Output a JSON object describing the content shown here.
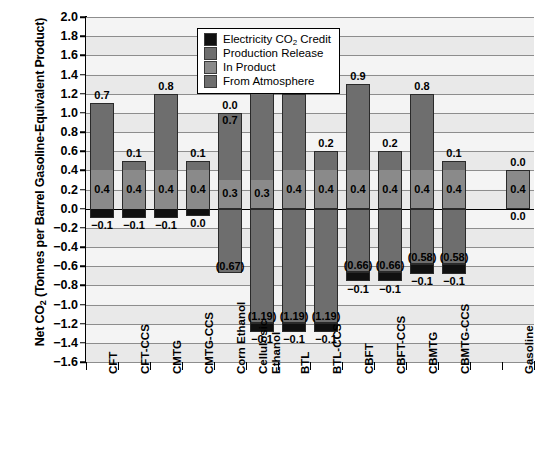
{
  "chart_data": {
    "type": "bar",
    "title": "",
    "xlabel": "",
    "ylabel": "Net CO2 (Tonnes per Barrel Gasoline-Equivalent Product)",
    "ylabel_prefix": "Net CO",
    "ylabel_sub": "2",
    "ylabel_suffix": " (Tonnes per Barrel Gasoline-Equivalent Product)",
    "ylim": [
      -1.6,
      2.0
    ],
    "ytick_step": 0.2,
    "ytick_labels": [
      "2.0",
      "1.8",
      "1.6",
      "1.4",
      "1.2",
      "1.0",
      "0.8",
      "0.6",
      "0.4",
      "0.2",
      "0.0",
      "−0.2",
      "−0.4",
      "−0.6",
      "−0.8",
      "−1.0",
      "−1.2",
      "−1.4",
      "−1.6"
    ],
    "grid": true,
    "legend_position": "top-center",
    "stacked": true,
    "categories": [
      "CFT",
      "CFT-CCS",
      "CMTG",
      "CMTG-CCS",
      "Corn Ethanol",
      "Cellulosic Ethanol",
      "BTL",
      "BTL-CCS",
      "CBFT",
      "CBFT-CCS",
      "CBMTG",
      "CBMTG-CCS",
      "",
      "Gasoline"
    ],
    "series": [
      {
        "name": "From Atmosphere",
        "color": "#6e6e6e",
        "values": [
          0,
          0,
          0,
          0,
          -0.67,
          -1.19,
          -1.19,
          -1.19,
          -0.66,
          -0.66,
          -0.58,
          -0.58,
          null,
          0
        ]
      },
      {
        "name": "In Product",
        "color": "#8a8a8a",
        "values": [
          0.4,
          0.4,
          0.4,
          0.4,
          0.3,
          0.3,
          0.4,
          0.4,
          0.4,
          0.4,
          0.4,
          0.4,
          null,
          0.4
        ]
      },
      {
        "name": "Production Release",
        "color": "#6e6e6e",
        "values": [
          0.7,
          0.1,
          0.8,
          0.1,
          0.0,
          1.0,
          0.8,
          0.2,
          0.9,
          0.2,
          0.8,
          0.1,
          null,
          0.0
        ]
      },
      {
        "name": "Electricity CO2 Credit",
        "color": "#101010",
        "values": [
          -0.1,
          -0.1,
          -0.1,
          0.0,
          0.0,
          -0.1,
          -0.1,
          -0.1,
          -0.1,
          -0.1,
          -0.1,
          -0.1,
          null,
          0.0
        ]
      }
    ],
    "bars": [
      {
        "category": "CFT",
        "top_label": "0.7",
        "mid_label": "0.4",
        "bottom_label": "−0.1",
        "atm_label": null,
        "top": 1.1,
        "pos_split": 0.4,
        "elec_bottom": -0.1
      },
      {
        "category": "CFT-CCS",
        "top_label": "0.1",
        "mid_label": "0.4",
        "bottom_label": "−0.1",
        "atm_label": null,
        "top": 0.5,
        "pos_split": 0.4,
        "elec_bottom": -0.1
      },
      {
        "category": "CMTG",
        "top_label": "0.8",
        "mid_label": "0.4",
        "bottom_label": "−0.1",
        "atm_label": null,
        "top": 1.2,
        "pos_split": 0.4,
        "elec_bottom": -0.1
      },
      {
        "category": "CMTG-CCS",
        "top_label": "0.1",
        "mid_label": "0.4",
        "bottom_label": "0.0",
        "atm_label": null,
        "top": 0.5,
        "pos_split": 0.4,
        "elec_bottom": -0.08
      },
      {
        "category": "Corn Ethanol",
        "top_label": "0.0",
        "mid_label": "0.3",
        "bottom_label": null,
        "atm_label": "(0.67)",
        "second_label": "0.7",
        "top": 1.0,
        "pos_split": 0.3,
        "elec_bottom": 0,
        "atm": -0.67
      },
      {
        "category": "Cellulosic Ethanol",
        "top_label": "1.0",
        "mid_label": "0.3",
        "bottom_label": "−0.1",
        "atm_label": "(1.19)",
        "top": 1.3,
        "pos_split": 0.3,
        "elec_bottom": -0.1,
        "atm": -1.19
      },
      {
        "category": "BTL",
        "top_label": "0.8",
        "mid_label": "0.4",
        "bottom_label": "−0.1",
        "atm_label": "(1.19)",
        "top": 1.2,
        "pos_split": 0.4,
        "elec_bottom": -0.1,
        "atm": -1.19
      },
      {
        "category": "BTL-CCS",
        "top_label": "0.2",
        "mid_label": "0.4",
        "bottom_label": "−0.1",
        "atm_label": "(1.19)",
        "top": 0.6,
        "pos_split": 0.4,
        "elec_bottom": -0.1,
        "atm": -1.19
      },
      {
        "category": "CBFT",
        "top_label": "0.9",
        "mid_label": "0.4",
        "bottom_label": "−0.1",
        "atm_label": "(0.66)",
        "top": 1.3,
        "pos_split": 0.4,
        "elec_bottom": -0.1,
        "atm": -0.66
      },
      {
        "category": "CBFT-CCS",
        "top_label": "0.2",
        "mid_label": "0.4",
        "bottom_label": "−0.1",
        "atm_label": "(0.66)",
        "top": 0.6,
        "pos_split": 0.4,
        "elec_bottom": -0.1,
        "atm": -0.66
      },
      {
        "category": "CBMTG",
        "top_label": "0.8",
        "mid_label": "0.4",
        "bottom_label": "−0.1",
        "atm_label": "(0.58)",
        "top": 1.2,
        "pos_split": 0.4,
        "elec_bottom": -0.1,
        "atm": -0.58
      },
      {
        "category": "CBMTG-CCS",
        "top_label": "0.1",
        "mid_label": "0.4",
        "bottom_label": "−0.1",
        "atm_label": "(0.58)",
        "top": 0.5,
        "pos_split": 0.4,
        "elec_bottom": -0.1,
        "atm": -0.58
      },
      {
        "category": "Gasoline",
        "top_label": "0.0",
        "mid_label": "0.4",
        "bottom_label": "0.0",
        "atm_label": null,
        "top": 0.4,
        "pos_split": 0.4,
        "elec_bottom": 0
      }
    ]
  },
  "legend": {
    "items": [
      {
        "label": "Electricity CO2 Credit",
        "label_prefix": "Electricity CO",
        "label_sub": "2",
        "label_suffix": " Credit",
        "color": "#101010"
      },
      {
        "label": "Production Release",
        "label_prefix": "Production Release",
        "label_sub": "",
        "label_suffix": "",
        "color": "#6e6e6e"
      },
      {
        "label": "In Product",
        "label_prefix": "In Product",
        "label_sub": "",
        "label_suffix": "",
        "color": "#8a8a8a"
      },
      {
        "label": "From Atmosphere",
        "label_prefix": "From Atmosphere",
        "label_sub": "",
        "label_suffix": "",
        "color": "#6e6e6e"
      }
    ]
  },
  "axis": {
    "y_tick_labels": [
      "2.0",
      "1.8",
      "1.6",
      "1.4",
      "1.2",
      "1.0",
      "0.8",
      "0.6",
      "0.4",
      "0.2",
      "0.0",
      "−0.2",
      "−0.4",
      "−0.6",
      "−0.8",
      "−1.0",
      "−1.2",
      "−1.4",
      "−1.6"
    ],
    "x_tick_labels": [
      "CFT",
      "CFT-CCS",
      "CMTG",
      "CMTG-CCS",
      "Corn Ethanol",
      "Cellulosic Ethanol",
      "BTL",
      "BTL-CCS",
      "CBFT",
      "CBFT-CCS",
      "CBMTG",
      "CBMTG-CCS",
      "Gasoline"
    ]
  }
}
